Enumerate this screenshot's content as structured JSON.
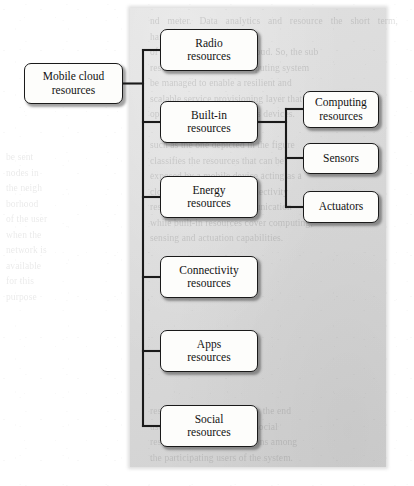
{
  "figure": {
    "type": "tree-diagram",
    "panel_color": "#d9d9d9",
    "node_fill": "#fdfdfb",
    "node_border": "#1a1a1a",
    "connector_color": "#1a1a1a",
    "root": {
      "id": "mobile-cloud-resources",
      "line1": "Mobile cloud",
      "line2": "resources"
    },
    "branches": [
      {
        "id": "radio-resources",
        "line1": "Radio",
        "line2": "resources"
      },
      {
        "id": "built-in-resources",
        "line1": "Built-in",
        "line2": "resources"
      },
      {
        "id": "energy-resources",
        "line1": "Energy",
        "line2": "resources"
      },
      {
        "id": "connectivity-resources",
        "line1": "Connectivity",
        "line2": "resources"
      },
      {
        "id": "apps-resources",
        "line1": "Apps",
        "line2": "resources"
      },
      {
        "id": "social-resources",
        "line1": "Social",
        "line2": "resources"
      }
    ],
    "sub_branches": [
      {
        "id": "computing-resources",
        "line1": "Computing",
        "line2": "resources"
      },
      {
        "id": "sensors",
        "line1": "Sensors",
        "line2": ""
      },
      {
        "id": "actuators",
        "line1": "Actuators",
        "line2": ""
      }
    ]
  },
  "background_text": {
    "right": "nd meter. Data analytics and resource the short term, harvesting and\nof the distributed mobile cloud. So, the sub\nresources of the cloud computing system\nbe managed to enable a resilient and\nscalable service provisioning layer that\noperates over heterogeneous devices.\n\nsuch as the one depicted in the figure\nclassifies the resources that can be\nexposed by a mobile device acting as a\ncloud node. Radio and connectivity\nresources enable the communication\nwhile built-in resources cover computing,\nsensing and actuation capabilities.",
    "left": "be sent\nnodes in\nthe neigh\nborhood\nof the user\nwhen the\nnetwork is\navailable\nfor this\npurpose",
    "bottom": "resources are contributed by the end\nuser applications, whereas social\nresources capture the relations among\nthe participating users of the system."
  }
}
